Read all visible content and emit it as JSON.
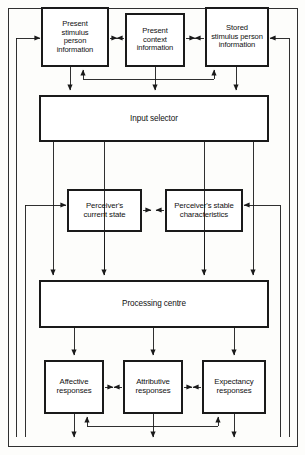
{
  "diagram": {
    "stroke_color": "#1a1a1a",
    "fill_color": "#ffffff",
    "background_color": "#fdfdfb",
    "nodes": [
      {
        "id": "present-stimulus-person-information",
        "label": "Present\nstimulus\nperson\ninformation",
        "x": 42,
        "y": 8,
        "w": 66,
        "h": 58,
        "font_size": 7.6
      },
      {
        "id": "present-context-information",
        "label": "Present\ncontext\ninformation",
        "x": 126,
        "y": 14,
        "w": 58,
        "h": 52,
        "font_size": 7.6
      },
      {
        "id": "stored-stimulus-person-information",
        "label": "Stored\nstimulus person\ninformation",
        "x": 206,
        "y": 8,
        "w": 62,
        "h": 58,
        "font_size": 7.6
      },
      {
        "id": "input-selector",
        "label": "Input selector",
        "x": 40,
        "y": 96,
        "w": 228,
        "h": 45,
        "font_size": 8.2
      },
      {
        "id": "perceivers-current-state",
        "label": "Perceiver's\ncurrent state",
        "x": 68,
        "y": 190,
        "w": 73,
        "h": 41,
        "font_size": 7.8
      },
      {
        "id": "perceivers-stable-characteristics",
        "label": "Perceiver's  stable\ncharacteristics",
        "x": 166,
        "y": 190,
        "w": 76,
        "h": 41,
        "font_size": 7.8
      },
      {
        "id": "processing-centre",
        "label": "Processing centre",
        "x": 40,
        "y": 281,
        "w": 228,
        "h": 46,
        "font_size": 8.2
      },
      {
        "id": "affective-responses",
        "label": "Affective\nresponses",
        "x": 45,
        "y": 361,
        "w": 58,
        "h": 52,
        "font_size": 7.8
      },
      {
        "id": "attributive-responses",
        "label": "Attributive\nresponses",
        "x": 124,
        "y": 361,
        "w": 58,
        "h": 52,
        "font_size": 7.8
      },
      {
        "id": "expectancy-responses",
        "label": "Expectancy\nresponses",
        "x": 203,
        "y": 361,
        "w": 62,
        "h": 52,
        "font_size": 7.8
      }
    ],
    "labels": {
      "box1": "Present\nstimulus\nperson\ninformation",
      "box2": "Present\ncontext\ninformation",
      "box3": "Stored\nstimulus person\ninformation",
      "box4": "Input selector",
      "box5": "Perceiver's\ncurrent state",
      "box6": "Perceiver's  stable\ncharacteristics",
      "box7": "Processing centre",
      "box8": "Affective\nresponses",
      "box9": "Attributive\nresponses",
      "box10": "Expectancy\nresponses"
    },
    "edges": [
      {
        "id": "box1-to-box2",
        "type": "bidirectional-horizontal",
        "from": "present-stimulus-person-information",
        "to": "present-context-information"
      },
      {
        "id": "box2-to-box3",
        "type": "bidirectional-horizontal",
        "from": "present-context-information",
        "to": "stored-stimulus-person-information"
      },
      {
        "id": "box1-to-input-selector",
        "type": "down-arrow",
        "from": "present-stimulus-person-information",
        "to": "input-selector"
      },
      {
        "id": "box2-to-input-selector",
        "type": "down-arrow",
        "from": "present-context-information",
        "to": "input-selector"
      },
      {
        "id": "box3-to-input-selector",
        "type": "down-arrow",
        "from": "stored-stimulus-person-information",
        "to": "input-selector"
      },
      {
        "id": "feedback-bus-top",
        "type": "bus-up-arrows",
        "from": "input-selector",
        "to": "top-row"
      },
      {
        "id": "input-selector-to-processing-centre",
        "type": "down-arrow",
        "from": "input-selector",
        "to": "processing-centre"
      },
      {
        "id": "input-selector-to-perceivers-current-state",
        "type": "down-arrow",
        "from": "input-selector",
        "to": "processing-centre"
      },
      {
        "id": "perceivers-current-state-to-stable",
        "type": "bidirectional-horizontal",
        "from": "perceivers-current-state",
        "to": "perceivers-stable-characteristics"
      },
      {
        "id": "perceivers-current-state-to-processing-centre",
        "type": "down-arrow",
        "from": "perceivers-current-state",
        "to": "processing-centre"
      },
      {
        "id": "perceivers-stable-to-processing-centre",
        "type": "down-arrow",
        "from": "perceivers-stable-characteristics",
        "to": "processing-centre"
      },
      {
        "id": "processing-centre-to-affective",
        "type": "down-arrow",
        "from": "processing-centre",
        "to": "affective-responses"
      },
      {
        "id": "processing-centre-to-attributive",
        "type": "down-arrow",
        "from": "processing-centre",
        "to": "attributive-responses"
      },
      {
        "id": "processing-centre-to-expectancy",
        "type": "down-arrow",
        "from": "processing-centre",
        "to": "expectancy-responses"
      },
      {
        "id": "affective-to-attributive",
        "type": "bidirectional-horizontal",
        "from": "affective-responses",
        "to": "attributive-responses"
      },
      {
        "id": "attributive-to-expectancy",
        "type": "bidirectional-horizontal",
        "from": "attributive-responses",
        "to": "expectancy-responses"
      },
      {
        "id": "response-bus-feedback",
        "type": "bus-up-arrows",
        "from": "bottom-bus",
        "to": "response-row"
      },
      {
        "id": "bottom-bus-to-left-return",
        "type": "feedback-loop-left",
        "from": "response-row",
        "to": "present-stimulus-person-information"
      },
      {
        "id": "bottom-bus-to-right-return",
        "type": "feedback-loop-right",
        "from": "response-row",
        "to": "stored-stimulus-person-information"
      },
      {
        "id": "left-return-to-perceivers-current-state",
        "type": "feedback-loop-left",
        "from": "response-row",
        "to": "perceivers-current-state"
      },
      {
        "id": "right-return-to-perceivers-stable",
        "type": "feedback-loop-right",
        "from": "response-row",
        "to": "perceivers-stable-characteristics"
      }
    ]
  }
}
